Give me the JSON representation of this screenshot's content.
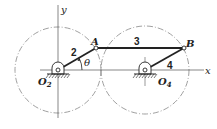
{
  "diagram": {
    "type": "four-bar linkage",
    "labels": {
      "y_axis": "y",
      "x_axis": "x",
      "pivot_left": "O",
      "pivot_left_sub": "2",
      "pivot_right": "O",
      "pivot_right_sub": "4",
      "joint_a": "A",
      "joint_b": "B",
      "link_2": "2",
      "link_3": "3",
      "link_4": "4",
      "angle": "θ"
    },
    "colors": {
      "line": "#222222",
      "circle": "#777777",
      "axis": "#555555"
    }
  }
}
